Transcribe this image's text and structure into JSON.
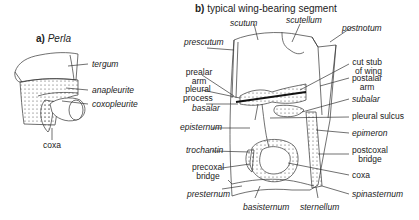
{
  "panel_a": {
    "letter": "a)",
    "title": "Perla",
    "labels": {
      "tergum": "tergum",
      "anapleurite": "anapleurite",
      "coxopleurite": "coxopleurite",
      "coxa": "coxa"
    }
  },
  "panel_b": {
    "letter": "b)",
    "title": "typical wing-bearing segment",
    "labels": {
      "scutum": "scutum",
      "scutellum": "scutellum",
      "postnotum": "postnotum",
      "prescutum": "prescutum",
      "prealar_arm_1": "prealar",
      "prealar_arm_2": "arm",
      "pleural_process_1": "pleural",
      "pleural_process_2": "process",
      "basalar": "basalar",
      "episternum": "episternum",
      "trochantin": "trochantin",
      "precoxal_bridge_1": "precoxal",
      "precoxal_bridge_2": "bridge",
      "presternum": "presternum",
      "basisternum": "basisternum",
      "sternellum": "sternellum",
      "cut_stub_1": "cut stub",
      "cut_stub_2": "of wing",
      "postalar_arm_1": "postalar",
      "postalar_arm_2": "arm",
      "subalar": "subalar",
      "pleural_sulcus": "pleural sulcus",
      "epimeron": "epimeron",
      "postcoxal_bridge_1": "postcoxal",
      "postcoxal_bridge_2": "bridge",
      "coxa": "coxa",
      "spinasternum": "spinasternum"
    }
  },
  "colors": {
    "line": "#333333",
    "dots": "#444444",
    "background": "#ffffff"
  }
}
